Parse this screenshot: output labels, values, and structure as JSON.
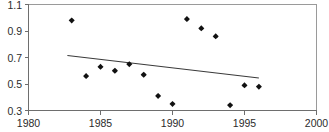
{
  "chart_data": {
    "type": "scatter",
    "title": "",
    "subtitle": "",
    "xlabel": "",
    "ylabel": "",
    "xlim": [
      1980,
      2000
    ],
    "ylim": [
      0.3,
      1.1
    ],
    "grid": false,
    "legend": null,
    "x_ticks": [
      1980,
      1985,
      1990,
      1995,
      2000
    ],
    "x_tick_labels": [
      "1980",
      "1985",
      "1990",
      "1995",
      "2000"
    ],
    "y_ticks": [
      0.3,
      0.5,
      0.7,
      0.9,
      1.1
    ],
    "y_tick_labels": [
      "0.3",
      "0.5",
      "0.7",
      "0.9",
      "1.1"
    ],
    "series": [
      {
        "name": "observations",
        "marker": "diamond",
        "color": "#111111",
        "x": [
          1983,
          1984,
          1985,
          1986,
          1987,
          1988,
          1989,
          1990,
          1991,
          1992,
          1993,
          1994,
          1995,
          1996
        ],
        "y": [
          0.98,
          0.56,
          0.63,
          0.6,
          0.65,
          0.57,
          0.41,
          0.35,
          0.99,
          0.92,
          0.86,
          0.34,
          0.49,
          0.48
        ]
      },
      {
        "name": "trend-line",
        "marker": "none",
        "color": "#3a3a3a",
        "x": [
          1982.7,
          1996.0
        ],
        "y": [
          0.715,
          0.545
        ]
      }
    ],
    "annotations": []
  },
  "axes": {
    "y_axis_name": "value-axis",
    "x_axis_name": "year-axis"
  }
}
